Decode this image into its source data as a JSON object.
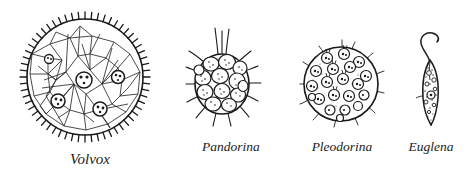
{
  "figure": {
    "background_color": "#ffffff",
    "ink_color": "#1a1a1a",
    "width": 470,
    "height": 180,
    "style": "black ink line drawing, scientific illustration"
  },
  "organisms": [
    {
      "id": "volvox",
      "label": "Volvox",
      "shape": "sphere",
      "description": "large spherical colony with dense polygonal net of interconnected cells and radiating flagella around the rim",
      "daughter_colony_count": 5,
      "relative_size": "largest",
      "flagella": "many short spikes around entire circumference"
    },
    {
      "id": "pandorina",
      "label": "Pandorina",
      "shape": "oval",
      "description": "oval envelope packed with about 13 rounded stippled cells, long flagella radiating outward",
      "cell_count": 13,
      "relative_size": "small",
      "flagella": "long hairs radiating from envelope, longest at top"
    },
    {
      "id": "pleodorina",
      "label": "Pleodorina",
      "shape": "sphere",
      "description": "round stippled colony containing about 20 discrete circular cells with paired flagella",
      "cell_count": 20,
      "relative_size": "medium",
      "flagella": "fine short hairs around rim"
    },
    {
      "id": "euglena",
      "label": "Euglena",
      "shape": "spindle",
      "description": "elongate spindle-shaped single cell with granular cytoplasm, central nucleus and one long S-curved anterior flagellum",
      "cell_count": 1,
      "relative_size": "narrow",
      "flagella": "single long curved flagellum at anterior end"
    }
  ]
}
